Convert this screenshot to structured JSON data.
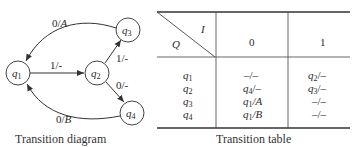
{
  "diagram": {
    "caption": "Transition diagram",
    "states": [
      {
        "id": "q1",
        "base": "q",
        "sub": "1"
      },
      {
        "id": "q2",
        "base": "q",
        "sub": "2"
      },
      {
        "id": "q3",
        "base": "q",
        "sub": "3"
      },
      {
        "id": "q4",
        "base": "q",
        "sub": "4"
      }
    ],
    "edges": [
      {
        "from": "q1",
        "to": "q2",
        "label_in": "1",
        "label_out": "-"
      },
      {
        "from": "q2",
        "to": "q3",
        "label_in": "1",
        "label_out": "-"
      },
      {
        "from": "q2",
        "to": "q4",
        "label_in": "0",
        "label_out": "-"
      },
      {
        "from": "q3",
        "to": "q1",
        "label_in": "0",
        "label_out": "A"
      },
      {
        "from": "q4",
        "to": "q1",
        "label_in": "0",
        "label_out": "B"
      }
    ]
  },
  "table": {
    "caption": "Transition table",
    "corner": {
      "input_label": "I",
      "state_label": "Q"
    },
    "columns": [
      "0",
      "1"
    ],
    "rows": [
      {
        "state": "q",
        "state_sub": "1",
        "c0": "–/–",
        "c1_base": "q",
        "c1_sub": "2",
        "c1_out": "/–"
      },
      {
        "state": "q",
        "state_sub": "2",
        "c0_base": "q",
        "c0_sub": "4",
        "c0_out": "/–",
        "c1_base": "q",
        "c1_sub": "3",
        "c1_out": "/–"
      },
      {
        "state": "q",
        "state_sub": "3",
        "c0_base": "q",
        "c0_sub": "1",
        "c0_out": "/A",
        "c1": "–/–"
      },
      {
        "state": "q",
        "state_sub": "4",
        "c0_base": "q",
        "c0_sub": "1",
        "c0_out": "/B",
        "c1": "–/–"
      }
    ]
  }
}
